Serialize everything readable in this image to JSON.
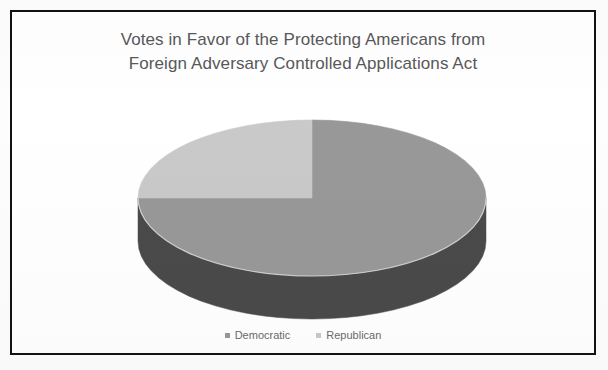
{
  "figure": {
    "title_line_1": "Votes in Favor of the Protecting Americans from",
    "title_line_2": "Foreign Adversary Controlled Applications Act",
    "border_color": "#121212",
    "background_color": "#ffffff",
    "title_color": "#58585a"
  },
  "legend": {
    "position": "bottom",
    "entries": [
      {
        "label": "Democratic",
        "color": "#989898",
        "marker": "square"
      },
      {
        "label": "Republican",
        "color": "#c9c9c9",
        "marker": "square"
      }
    ]
  },
  "chart_data": {
    "type": "pie",
    "title": "Votes in Favor of the Protecting Americans from Foreign Adversary Controlled Applications Act",
    "xlabel": "",
    "ylabel": "",
    "three_d": true,
    "start_angle_deg": 0,
    "direction": "clockwise",
    "categories": [
      "Democratic",
      "Republican"
    ],
    "values": [
      75,
      25
    ],
    "units": "percent of votes in favor",
    "slices": [
      {
        "name": "Democratic",
        "value": 75,
        "percent": 75,
        "color": "#989898",
        "side_color": "#4a4a4a",
        "start_angle_deg": 90,
        "end_angle_deg": 360
      },
      {
        "name": "Republican",
        "value": 25,
        "percent": 25,
        "color": "#c9c9c9",
        "side_color": "#6f6f6f",
        "start_angle_deg": 0,
        "end_angle_deg": 90
      }
    ],
    "legend": [
      "Democratic",
      "Republican"
    ],
    "grid": false,
    "data_labels_shown": false
  },
  "geometry": {
    "center_x": 300,
    "center_y": 186,
    "radius_x": 174,
    "radius_y": 78,
    "depth": 43
  }
}
